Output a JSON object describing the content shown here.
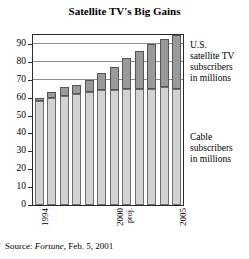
{
  "chart_data": {
    "type": "bar",
    "subtype": "stacked-bar",
    "title": "Satellite TV's Big Gains",
    "xlabel": "",
    "ylabel": "",
    "ylim": [
      0,
      95
    ],
    "yticks": [
      0,
      10,
      20,
      30,
      40,
      50,
      60,
      70,
      80,
      90
    ],
    "gridlines": [
      70,
      80,
      90
    ],
    "grid": true,
    "legend_position": "right-annotations",
    "categories": [
      "1994",
      "1995",
      "1996",
      "1997",
      "1998",
      "1999",
      "2000",
      "2001",
      "2002",
      "2003",
      "2004",
      "2005"
    ],
    "x_tick_labels_shown": [
      "1994",
      "2000",
      "2005"
    ],
    "x_tick_annotation": "proj.",
    "series": [
      {
        "name": "Cable subscribers in millions",
        "color": "#d2d2d2",
        "values": [
          58,
          60,
          61,
          62,
          63,
          64,
          64,
          65,
          65,
          65,
          66,
          65
        ]
      },
      {
        "name": "U.S. satellite TV subscribers in millions",
        "color": "#9a9a9a",
        "values": [
          2,
          3,
          5,
          5,
          7,
          10,
          13,
          17,
          21,
          25,
          27,
          30
        ]
      }
    ],
    "totals": [
      60,
      63,
      66,
      67,
      70,
      74,
      77,
      82,
      86,
      90,
      93,
      95
    ],
    "annotations": [
      {
        "id": "satellite-note",
        "text": "U.S. satellite TV subscribers in millions",
        "lines": [
          "U.S.",
          "satellite TV",
          "subscribers",
          "in millions"
        ]
      },
      {
        "id": "cable-note",
        "text": "Cable subscribers in millions",
        "lines": [
          "Cable",
          "subscribers",
          "in millions"
        ]
      }
    ],
    "source": {
      "prefix": "Source:",
      "publication": "Fortune",
      "suffix": ", Feb. 5, 2001",
      "full": "Source: Fortune, Feb. 5, 2001"
    }
  },
  "colors": {
    "cable": "#d2d2d2",
    "satellite": "#9a9a9a",
    "frame": "#2b2b2b",
    "grid": "#8c8c8c",
    "background": "#ffffff"
  }
}
